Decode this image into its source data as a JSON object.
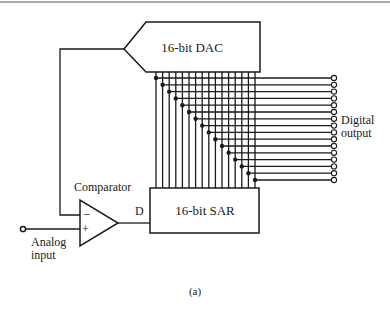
{
  "figure": {
    "caption": "(a)",
    "top_rule": true
  },
  "blocks": {
    "dac": {
      "label": "16-bit DAC"
    },
    "sar": {
      "label": "16-bit SAR"
    },
    "comparator": {
      "label": "Comparator",
      "minus_symbol": "−",
      "plus_symbol": "+",
      "output_label": "D"
    }
  },
  "io": {
    "analog_input": {
      "line1": "Analog",
      "line2": "input"
    },
    "digital_output": {
      "line1": "Digital",
      "line2": "output",
      "bits": 16
    }
  },
  "colors": {
    "ink": "#1a1a1a",
    "background": "#ffffff"
  }
}
